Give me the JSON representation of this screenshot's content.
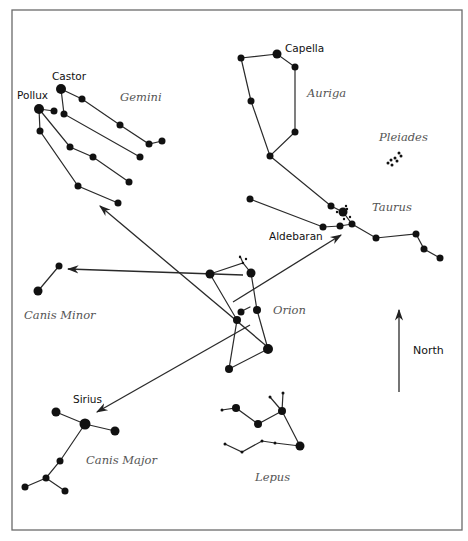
{
  "diagram": {
    "colors": {
      "ink": "#111111",
      "line": "#2a2a2a",
      "frame": "#6a6a6a",
      "label": "#555555"
    },
    "frame": {
      "x": 12,
      "y": 10,
      "width": 450,
      "height": 520
    },
    "star_labels": [
      {
        "id": "castor",
        "text": "Castor",
        "x": 52,
        "y": 80
      },
      {
        "id": "pollux",
        "text": "Pollux",
        "x": 17,
        "y": 99
      },
      {
        "id": "capella",
        "text": "Capella",
        "x": 285,
        "y": 52
      },
      {
        "id": "aldebaran",
        "text": "Aldebaran",
        "x": 269,
        "y": 240
      },
      {
        "id": "sirius",
        "text": "Sirius",
        "x": 73,
        "y": 403
      }
    ],
    "constellation_labels": [
      {
        "id": "gemini",
        "text": "Gemini",
        "x": 120,
        "y": 101
      },
      {
        "id": "auriga",
        "text": "Auriga",
        "x": 307,
        "y": 97
      },
      {
        "id": "pleiades",
        "text": "Pleiades",
        "x": 379,
        "y": 141
      },
      {
        "id": "taurus",
        "text": "Taurus",
        "x": 372,
        "y": 211
      },
      {
        "id": "canis-minor",
        "text": "Canis Minor",
        "x": 24,
        "y": 319
      },
      {
        "id": "orion",
        "text": "Orion",
        "x": 273,
        "y": 314
      },
      {
        "id": "canis-major",
        "text": "Canis Major",
        "x": 86,
        "y": 464
      },
      {
        "id": "lepus",
        "text": "Lepus",
        "x": 255,
        "y": 481
      }
    ],
    "north_indicator": {
      "label": "North",
      "x1": 399,
      "y1": 392,
      "x2": 399,
      "y2": 310,
      "label_x": 413,
      "label_y": 354
    },
    "constellations": {
      "gemini": {
        "lines": [
          [
            [
              39,
              109
            ],
            [
              54,
              111
            ]
          ],
          [
            [
              61,
              89
            ],
            [
              82,
              99
            ],
            [
              120,
              125
            ],
            [
              149,
              144
            ],
            [
              162,
              141
            ]
          ],
          [
            [
              61,
              89
            ],
            [
              64,
              114
            ],
            [
              140,
              157
            ]
          ],
          [
            [
              39,
              109
            ],
            [
              70,
              147
            ],
            [
              93,
              157
            ],
            [
              129,
              182
            ]
          ],
          [
            [
              39,
              109
            ],
            [
              40,
              131
            ],
            [
              78,
              186
            ],
            [
              118,
              203
            ]
          ]
        ],
        "stars": [
          [
            39,
            109,
            5
          ],
          [
            61,
            89,
            5
          ],
          [
            54,
            111,
            3.5
          ],
          [
            82,
            99,
            3.5
          ],
          [
            120,
            125,
            3.5
          ],
          [
            149,
            144,
            3.5
          ],
          [
            162,
            141,
            3.5
          ],
          [
            64,
            114,
            3.5
          ],
          [
            140,
            157,
            3.5
          ],
          [
            40,
            131,
            3.5
          ],
          [
            70,
            147,
            3.5
          ],
          [
            93,
            157,
            3.5
          ],
          [
            129,
            182,
            3.5
          ],
          [
            78,
            186,
            3.5
          ],
          [
            118,
            203,
            3.5
          ]
        ]
      },
      "auriga": {
        "lines": [
          [
            [
              241,
              58
            ],
            [
              277,
              54
            ],
            [
              295,
              67
            ],
            [
              295,
              132
            ],
            [
              270,
              156
            ],
            [
              251,
              101
            ],
            [
              241,
              58
            ]
          ],
          [
            [
              270,
              156
            ],
            [
              331,
              206
            ],
            [
              343,
              212
            ],
            [
              352,
              224
            ],
            [
              376,
              238
            ],
            [
              416,
              234
            ],
            [
              424,
              249
            ],
            [
              440,
              258
            ]
          ],
          [
            [
              250,
              199
            ],
            [
              323,
              227
            ],
            [
              340,
              226
            ],
            [
              352,
              224
            ]
          ]
        ],
        "stars": [
          [
            241,
            58,
            3.5
          ],
          [
            277,
            54,
            4.5
          ],
          [
            295,
            67,
            3.5
          ],
          [
            295,
            132,
            3.5
          ],
          [
            270,
            156,
            3.5
          ],
          [
            251,
            101,
            3.5
          ],
          [
            331,
            206,
            3.5
          ],
          [
            343,
            212,
            4.5
          ],
          [
            352,
            224,
            3.5
          ],
          [
            376,
            238,
            3.5
          ],
          [
            416,
            234,
            3.5
          ],
          [
            424,
            249,
            3.5
          ],
          [
            440,
            258,
            3.5
          ],
          [
            250,
            199,
            3.5
          ],
          [
            323,
            227,
            3.5
          ],
          [
            340,
            226,
            3.5
          ]
        ],
        "hyades_dots": [
          [
            337,
            212,
            1.2
          ],
          [
            347,
            209,
            1.2
          ],
          [
            350,
            217,
            1.2
          ],
          [
            344,
            219,
            1.2
          ],
          [
            346,
            206,
            1.2
          ]
        ]
      },
      "pleiades": {
        "dots": [
          [
            388,
            163,
            1.5
          ],
          [
            391,
            160,
            1.5
          ],
          [
            395,
            158,
            1.5
          ],
          [
            399,
            153,
            1.5
          ],
          [
            392,
            165,
            1.5
          ],
          [
            397,
            161,
            1.5
          ],
          [
            401,
            156,
            1.5
          ]
        ]
      },
      "orion": {
        "lines": [
          [
            [
              210,
              274
            ],
            [
              243,
              263
            ],
            [
              251,
              273
            ],
            [
              257,
              310
            ],
            [
              268,
              349
            ],
            [
              229,
              369
            ],
            [
              237,
              320
            ],
            [
              210,
              274
            ]
          ],
          [
            [
              243,
              263
            ],
            [
              240,
              256
            ]
          ],
          [
            [
              250,
              307
            ],
            [
              240,
              312
            ]
          ]
        ],
        "stars": [
          [
            210,
            274,
            4.5
          ],
          [
            251,
            273,
            4.5
          ],
          [
            257,
            310,
            4
          ],
          [
            268,
            349,
            5
          ],
          [
            229,
            369,
            4
          ],
          [
            237,
            320,
            4
          ],
          [
            241,
            312,
            3.5
          ],
          [
            243,
            263,
            1.2
          ],
          [
            246,
            259,
            1.2
          ],
          [
            240,
            257,
            1.2
          ]
        ]
      },
      "canis_minor": {
        "lines": [
          [
            [
              38,
              291
            ],
            [
              59,
              266
            ]
          ]
        ],
        "stars": [
          [
            38,
            291,
            4.5
          ],
          [
            59,
            266,
            3.5
          ]
        ]
      },
      "canis_major": {
        "lines": [
          [
            [
              56,
              412
            ],
            [
              85,
              424
            ],
            [
              115,
              431
            ]
          ],
          [
            [
              85,
              424
            ],
            [
              60,
              461
            ],
            [
              46,
              478
            ],
            [
              25,
              487
            ]
          ],
          [
            [
              46,
              478
            ],
            [
              65,
              491
            ]
          ]
        ],
        "stars": [
          [
            56,
            412,
            4.5
          ],
          [
            85,
            424,
            5.5
          ],
          [
            115,
            431,
            4.5
          ],
          [
            60,
            461,
            3.5
          ],
          [
            46,
            478,
            3.5
          ],
          [
            25,
            487,
            3.5
          ],
          [
            65,
            491,
            3.5
          ]
        ]
      },
      "lepus": {
        "lines": [
          [
            [
              222,
              410
            ],
            [
              236,
              408
            ],
            [
              258,
              424
            ],
            [
              282,
              411
            ],
            [
              300,
              446
            ]
          ],
          [
            [
              282,
              411
            ],
            [
              270,
              397
            ]
          ],
          [
            [
              282,
              411
            ],
            [
              283,
              393
            ]
          ],
          [
            [
              225,
              444
            ],
            [
              242,
              452
            ],
            [
              262,
              441
            ],
            [
              275,
              443
            ],
            [
              300,
              446
            ]
          ]
        ],
        "stars": [
          [
            236,
            408,
            4
          ],
          [
            258,
            424,
            4
          ],
          [
            282,
            411,
            4
          ],
          [
            300,
            446,
            4.5
          ],
          [
            222,
            410,
            1.5
          ],
          [
            270,
            397,
            1.5
          ],
          [
            283,
            393,
            1.5
          ],
          [
            225,
            444,
            1.5
          ],
          [
            242,
            452,
            1.5
          ],
          [
            262,
            441,
            1.5
          ],
          [
            275,
            443,
            1.5
          ]
        ]
      }
    },
    "pointer_arrows": [
      {
        "id": "to-gemini",
        "from": [
          270,
          349
        ],
        "to": [
          100,
          206
        ]
      },
      {
        "id": "to-canis-minor",
        "from": [
          243,
          275
        ],
        "to": [
          68,
          269
        ]
      },
      {
        "id": "to-aldebaran",
        "from": [
          233,
          302
        ],
        "to": [
          341,
          235
        ]
      },
      {
        "id": "to-sirius",
        "from": [
          250,
          325
        ],
        "to": [
          97,
          412
        ]
      }
    ]
  }
}
